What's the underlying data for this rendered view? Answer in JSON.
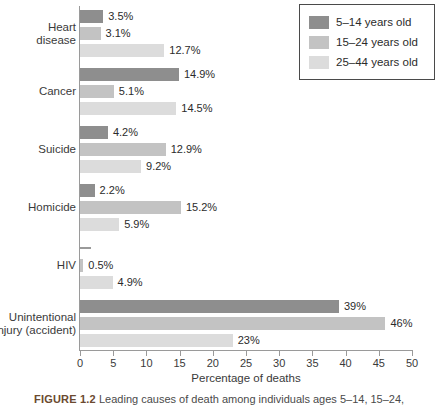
{
  "chart_data": {
    "type": "bar",
    "orientation": "horizontal",
    "title": "",
    "xlabel": "Percentage of deaths",
    "ylabel": "",
    "xlim": [
      0,
      50
    ],
    "xticks": [
      0,
      5,
      10,
      15,
      20,
      25,
      30,
      35,
      40,
      45,
      50
    ],
    "xticklabels": [
      "0",
      "5",
      "10",
      "15",
      "20",
      "25",
      "30",
      "35",
      "40",
      "45",
      "50"
    ],
    "grid": false,
    "legend_position": "top-right",
    "categories": [
      "Heart\ndisease",
      "Cancer",
      "Suicide",
      "Homicide",
      "HIV",
      "Unintentional\ninjury (accident)"
    ],
    "series": [
      {
        "name": "5–14 years old",
        "color": "#8e8e8e",
        "values": [
          3.5,
          14.9,
          4.2,
          2.2,
          0.2,
          39
        ],
        "labels": [
          "3.5%",
          "14.9%",
          "4.2%",
          "2.2%",
          "",
          "39%"
        ]
      },
      {
        "name": "15–24 years old",
        "color": "#c3c3c3",
        "values": [
          3.1,
          5.1,
          12.9,
          15.2,
          0.5,
          46
        ],
        "labels": [
          "3.1%",
          "5.1%",
          "12.9%",
          "15.2%",
          "0.5%",
          "46%"
        ]
      },
      {
        "name": "25–44 years old",
        "color": "#dcdcdc",
        "values": [
          12.7,
          14.5,
          9.2,
          5.9,
          4.9,
          23
        ],
        "labels": [
          "12.7%",
          "14.5%",
          "9.2%",
          "5.9%",
          "4.9%",
          "23%"
        ]
      }
    ]
  },
  "legend": {
    "items": [
      {
        "label": "5–14 years old"
      },
      {
        "label": "15–24 years old"
      },
      {
        "label": "25–44 years old"
      }
    ]
  },
  "axis": {
    "x_title": "Percentage of deaths"
  },
  "caption": {
    "figure_number": "FIGURE 1.2",
    "text": "Leading causes of death among individuals ages 5–14, 15–24,"
  }
}
